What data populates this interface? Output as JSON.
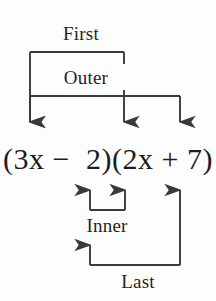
{
  "figure": {
    "name": "foil-method-diagram",
    "background_color": "#fdfdfd",
    "stroke_color": "#3a3a3a",
    "text_color": "#242424"
  },
  "expression": {
    "full_text": "(3x − 2)(2x + 7)",
    "left_open_paren": "(",
    "left_coefficient": "3",
    "left_variable": "x",
    "left_operator": "−",
    "left_constant": "2",
    "left_close_paren": ")",
    "right_open_paren": "(",
    "right_coefficient": "2",
    "right_variable": "x",
    "right_operator": "+",
    "right_constant": "7",
    "right_close_paren": ")"
  },
  "labels": {
    "first": "First",
    "outer": "Outer",
    "inner": "Inner",
    "last": "Last"
  },
  "brackets": [
    {
      "name": "first",
      "label": "First",
      "direction": "down",
      "from_term": "3x",
      "to_term": "2x"
    },
    {
      "name": "outer",
      "label": "Outer",
      "direction": "down",
      "from_term": "3x",
      "to_term": "7"
    },
    {
      "name": "inner",
      "label": "Inner",
      "direction": "up",
      "from_term": "2",
      "to_term": "2x"
    },
    {
      "name": "last",
      "label": "Last",
      "direction": "up",
      "from_term": "2",
      "to_term": "7"
    }
  ]
}
